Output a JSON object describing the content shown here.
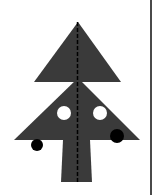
{
  "figure": {
    "colors": {
      "tree": "#3a3a3a",
      "ornament_light": "#ffffff",
      "ornament_dark": "#000000",
      "axis": "#000000",
      "border": "#4a4a4a",
      "background": "#ffffff"
    },
    "shapes": {
      "top_triangle": {
        "points": "78,22 34,82 121,82"
      },
      "bottom_triangle": {
        "points": "78,78 14,140 140,140"
      },
      "trunk": {
        "points": "63,140 90,140 92,182 61,182"
      },
      "ornaments": [
        {
          "cx": 64,
          "cy": 113,
          "r": 7,
          "fill": "#ffffff"
        },
        {
          "cx": 100,
          "cy": 113,
          "r": 7,
          "fill": "#ffffff"
        },
        {
          "cx": 37,
          "cy": 145,
          "r": 6,
          "fill": "#000000"
        },
        {
          "cx": 117,
          "cy": 136,
          "r": 7,
          "fill": "#000000"
        }
      ],
      "symmetry_axis": {
        "x": 77.5,
        "y1": 22,
        "y2": 182,
        "dash": "4 2"
      }
    }
  }
}
